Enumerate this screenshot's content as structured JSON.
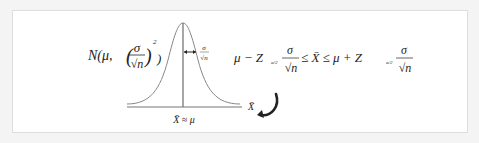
{
  "diagram": {
    "distribution_label": "N(μ,(σ/√n)²)",
    "dist_N": "N(μ,",
    "sigma": "σ",
    "sqrt_n": "√n",
    "exponent": "2",
    "close_paren": ")",
    "spread_label_num": "σ",
    "spread_label_den": "√n",
    "axis_label": "X̄",
    "center_label": "X̄ ≈ μ",
    "interval": {
      "left": "μ − Z",
      "sub": "α/2",
      "frac_num": "σ",
      "frac_den": "√n",
      "middle": "≤ X̄ ≤ μ + Z",
      "text": "μ − Z_{α/2} σ/√n ≤ X̄ ≤ μ + Z_{α/2} σ/√n"
    }
  }
}
